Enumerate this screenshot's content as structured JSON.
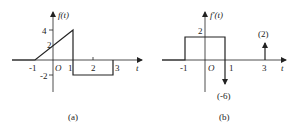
{
  "figures": [
    {
      "id": "a",
      "caption": "(a)",
      "y_axis_label": "f(t)",
      "x_axis_label": "t",
      "origin_label": "O",
      "x_ticks": [
        "-1",
        "1",
        "2",
        "3"
      ],
      "y_ticks": [
        "4",
        "2",
        "-2"
      ],
      "description": "Ramp from (-1,0) to (1,4), drop to -2 at t=1, constant -2 until t=3, back to 0 at t=3",
      "segments": [
        {
          "from": [
            -1,
            0
          ],
          "to": [
            1,
            4
          ]
        },
        {
          "from": [
            1,
            4
          ],
          "to": [
            1,
            -2
          ]
        },
        {
          "from": [
            1,
            -2
          ],
          "to": [
            3,
            -2
          ]
        },
        {
          "from": [
            3,
            -2
          ],
          "to": [
            3,
            0
          ]
        }
      ]
    },
    {
      "id": "b",
      "caption": "(b)",
      "y_axis_label": "f'(t)",
      "x_axis_label": "t",
      "origin_label": "O",
      "x_ticks": [
        "-1",
        "1",
        "3"
      ],
      "y_ticks": [
        "2"
      ],
      "description": "Rectangle of height 2 on (-1,1); impulse of weight -6 at t=1; impulse of weight 2 at t=3",
      "rect": {
        "t_start": -1,
        "t_end": 1,
        "height": 2
      },
      "impulses": [
        {
          "t": 1,
          "weight": -6,
          "label": "(-6)"
        },
        {
          "t": 3,
          "weight": 2,
          "label": "(2)"
        }
      ]
    }
  ],
  "colors": {
    "ink": "#222222",
    "background": "#ffffff"
  }
}
